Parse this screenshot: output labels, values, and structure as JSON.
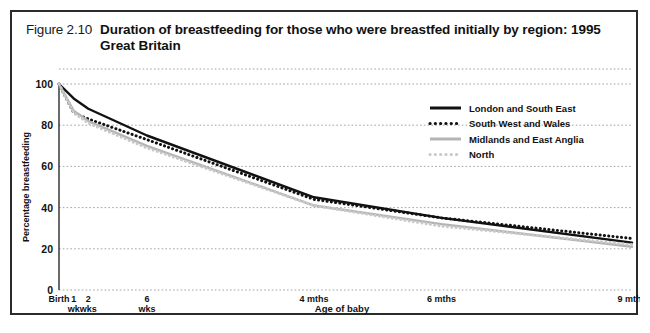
{
  "figure": {
    "number": "Figure 2.10",
    "title": "Duration of breastfeeding for those who were breastfed initially by region: 1995 Great Britain"
  },
  "colors": {
    "dark": "#111111",
    "gray": "#b4b4b4",
    "light_gray": "#c9c9c9",
    "frame": "#2b2b2b",
    "grid": "#9a9a9a",
    "background": "#ffffff"
  },
  "chart_data": {
    "type": "line",
    "title": "Duration of breastfeeding for those who were breastfed initially by region: 1995 Great Britain",
    "xlabel": "Age of baby",
    "ylabel": "Percentage breastfeeding",
    "ylim": [
      0,
      100
    ],
    "yticks": [
      0,
      20,
      40,
      60,
      80,
      100
    ],
    "grid": true,
    "legend_position": "top-right",
    "x": [
      0,
      1,
      2,
      6,
      17.4,
      26.1,
      39.1
    ],
    "xtick_positions": [
      0,
      1,
      2,
      6,
      17.4,
      26.1,
      39.1
    ],
    "xtick_labels": [
      "Birth",
      "1 wk",
      "2 wks",
      "6 wks",
      "4 mths",
      "6 mths",
      "9 mths"
    ],
    "xtick_label_lines": [
      [
        "Birth",
        ""
      ],
      [
        "1",
        "wk"
      ],
      [
        "2",
        "wks"
      ],
      [
        "6",
        "wks"
      ],
      [
        "4 mths",
        ""
      ],
      [
        "6 mths",
        ""
      ],
      [
        "9 mths",
        ""
      ]
    ],
    "series": [
      {
        "name": "London and South East",
        "style": "solid",
        "color": "#111111",
        "values": [
          100,
          93,
          88,
          75,
          45,
          35,
          23
        ]
      },
      {
        "name": "South West and Wales",
        "style": "dotted",
        "color": "#111111",
        "values": [
          100,
          86,
          83,
          73,
          44,
          35,
          25
        ]
      },
      {
        "name": "Midlands and East Anglia",
        "style": "solid",
        "color": "#b4b4b4",
        "values": [
          100,
          87,
          82,
          70,
          41,
          32,
          21
        ]
      },
      {
        "name": "North",
        "style": "dotted",
        "color": "#c9c9c9",
        "values": [
          100,
          86,
          81,
          69,
          41,
          31,
          22
        ]
      }
    ]
  },
  "legend": {
    "items": [
      {
        "label": "London and South East",
        "style": "solid",
        "color": "#111111"
      },
      {
        "label": "South West and Wales",
        "style": "dotted",
        "color": "#111111"
      },
      {
        "label": "Midlands and East Anglia",
        "style": "solid",
        "color": "#b4b4b4"
      },
      {
        "label": "North",
        "style": "dotted",
        "color": "#c9c9c9"
      }
    ]
  }
}
